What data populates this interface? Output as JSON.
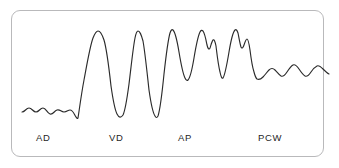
{
  "figure": {
    "kind": "pressure-waveform-tracing",
    "border_color": "#b9b9bb",
    "trace_color": "#2b2b2b",
    "background_color": "#ffffff"
  },
  "labels": {
    "ad": "AD",
    "vd": "VD",
    "ap": "AP",
    "pcw": "PCW"
  },
  "chart_data": {
    "type": "line",
    "title": "",
    "xlabel": "",
    "ylabel": "",
    "grid": false,
    "legend": "none",
    "xlim": [
      0,
      339
    ],
    "ylim": [
      168,
      0
    ],
    "annotations": [
      "AD",
      "VD",
      "AP",
      "PCW"
    ],
    "segments": [
      {
        "name": "AD",
        "label": "AD",
        "label_x": 36,
        "label_y": 132,
        "description": "right atrial pressure - low amplitude a and v waves on low baseline",
        "x_range": [
          22,
          78
        ],
        "baseline_y": 113,
        "amplitude": 7
      },
      {
        "name": "VD",
        "label": "VD",
        "label_x": 109,
        "label_y": 132,
        "description": "right ventricular pressure - tall systolic peaks with low diastolic troughs",
        "x_range": [
          78,
          148
        ],
        "peak_y": 32,
        "trough_y": 118,
        "amplitude": 86
      },
      {
        "name": "AP",
        "label": "AP",
        "label_x": 178,
        "label_y": 132,
        "description": "pulmonary artery pressure - systolic peaks with dicrotic notch and elevated diastolic",
        "x_range": [
          148,
          240
        ],
        "peak_y": 30,
        "trough_y": 80,
        "amplitude": 50
      },
      {
        "name": "PCW",
        "label": "PCW",
        "label_x": 258,
        "label_y": 132,
        "description": "pulmonary capillary wedge pressure - low amplitude damped a and v waves",
        "x_range": [
          240,
          318
        ],
        "baseline_y": 72,
        "amplitude": 8
      }
    ],
    "path": "M 22,112 C 25,112 26,108 29,108 C 32,108 33,112 36,112 C 39,112 40,108 43,108 C 46,108 47,113 50,114 C 53,115 54,111 57,110 C 60,109 61,112 64,112 C 67,112 68,110 70,110 C 73,110 74,114 76,117 C 77,118 77,119 78,118 C 79,112 81,96 84,80 C 87,64 90,46 93,38 C 95,33 97,31 98,31 C 100,31 102,34 104,40 C 107,50 109,68 111,86 C 113,100 115,110 117,114 C 119,118 121,118 123,115 C 125,111 127,99 129,84 C 131,68 133,48 135,38 C 136,33 137,31 138,31 C 140,31 141,34 143,41 C 145,52 147,72 149,90 C 151,104 153,113 155,116 C 156,118 157,118 158,116 C 160,110 162,94 164,74 C 166,56 168,40 170,33 C 171,30 172,29 173,30 C 175,32 177,40 179,52 C 181,64 183,74 185,78 C 186,80 187,81 188,80 C 190,78 192,70 194,58 C 196,46 198,36 200,32 C 201,30 202,30 203,31 C 205,34 206,40 207,45 C 208,49 209,50 210,48 C 211,45 212,41 213,40 C 214,39 215,41 216,46 C 217,54 218,64 220,72 C 221,77 222,79 223,78 C 225,75 227,64 229,52 C 231,40 233,32 235,30 C 236,29 237,30 238,33 C 239,38 240,44 241,47 C 242,49 243,48 244,45 C 245,42 246,39 247,39 C 248,39 249,43 250,50 C 251,58 252,66 254,72 C 255,76 256,78 257,79 C 259,80 261,79 263,77 C 265,75 267,72 269,70 C 271,68 273,68 275,70 C 277,72 279,75 281,76 C 283,77 285,75 287,72 C 289,69 291,66 293,65 C 295,64 297,66 299,69 C 301,72 303,75 305,76 C 307,77 309,75 311,72 C 313,69 315,67 317,66 C 319,65 321,67 323,69 C 325,71 327,73 329,74"
  }
}
